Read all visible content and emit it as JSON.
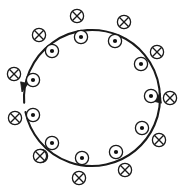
{
  "figure": {
    "title": "Circular loop with magnetic field symbols",
    "background_color": "#ffffff",
    "stroke_color": "#1a1a1a"
  },
  "loop": {
    "label": "current-loop",
    "center_x": 92,
    "center_y": 98,
    "radius": 68,
    "stroke_width": 2.1,
    "stroke_color": "#1a1a1a",
    "fill": "none",
    "gap_start_deg": 168,
    "gap_end_deg": 176
  },
  "arrows": [
    {
      "name": "arrowhead-left",
      "tip_x": 22,
      "tip_y": 92,
      "angle_deg": 104,
      "direction": "downward-left",
      "size": 9.5,
      "color": "#1a1a1a"
    },
    {
      "name": "arrowhead-right",
      "tip_x": 160,
      "tip_y": 93,
      "angle_deg": -76,
      "direction": "upward-right",
      "size": 9.5,
      "color": "#1a1a1a"
    }
  ],
  "symbol_style": {
    "cross_radius": 6.6,
    "dot_radius": 6.6,
    "dot_center_radius": 2.1,
    "stroke_width": 1.3,
    "stroke_color": "#1a1a1a",
    "fill_color": "#ffffff",
    "dot_fill_color": "#111111"
  },
  "symbols": {
    "into_page_glyph": "⊗",
    "out_of_page_glyph": "⊙",
    "into_page_label": "field-into-page",
    "out_of_page_label": "field-out-of-page",
    "into_page_count": 12,
    "out_of_page_count": 12
  },
  "into_page_markers": [
    {
      "name": "cross-top",
      "x": 77,
      "y": 16
    },
    {
      "name": "cross-top-right",
      "x": 124,
      "y": 22
    },
    {
      "name": "cross-upper-left",
      "x": 39,
      "y": 35
    },
    {
      "name": "cross-right-upper",
      "x": 157,
      "y": 52
    },
    {
      "name": "cross-left-upper",
      "x": 14,
      "y": 74
    },
    {
      "name": "cross-right-mid",
      "x": 170,
      "y": 98
    },
    {
      "name": "cross-left-mid",
      "x": 15,
      "y": 118
    },
    {
      "name": "cross-right-lower",
      "x": 159,
      "y": 140
    },
    {
      "name": "cross-lower-left",
      "x": 41,
      "y": 156
    },
    {
      "name": "cross-lower-right",
      "x": 125,
      "y": 170
    },
    {
      "name": "cross-bottom",
      "x": 79,
      "y": 178
    },
    {
      "name": "cross-left-lower",
      "x": 40,
      "y": 156
    }
  ],
  "out_of_page_markers": [
    {
      "name": "dot-top",
      "x": 81,
      "y": 37
    },
    {
      "name": "dot-top-right",
      "x": 115,
      "y": 41
    },
    {
      "name": "dot-upper-left",
      "x": 52,
      "y": 51
    },
    {
      "name": "dot-right-upper",
      "x": 141,
      "y": 64
    },
    {
      "name": "dot-left-upper",
      "x": 33,
      "y": 80
    },
    {
      "name": "dot-right-mid",
      "x": 151,
      "y": 96
    },
    {
      "name": "dot-left-mid",
      "x": 33,
      "y": 115
    },
    {
      "name": "dot-right-lower",
      "x": 142,
      "y": 128
    },
    {
      "name": "dot-lower-left",
      "x": 52,
      "y": 143
    },
    {
      "name": "dot-lower-right",
      "x": 116,
      "y": 152
    },
    {
      "name": "dot-bottom",
      "x": 82,
      "y": 158
    },
    {
      "name": "dot-left-lower",
      "x": 52,
      "y": 143
    }
  ]
}
